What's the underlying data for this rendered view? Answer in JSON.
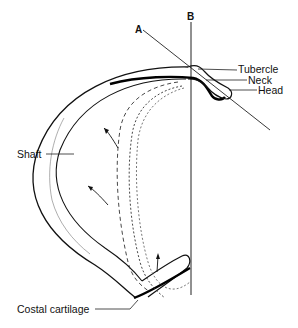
{
  "diagram": {
    "type": "anatomical-line-drawing",
    "axis_labels": {
      "a": "A",
      "b": "B"
    },
    "labels": {
      "tubercle": "Tubercle",
      "neck": "Neck",
      "head": "Head",
      "shaft": "Shaft",
      "costal_cartilage": "Costal cartilage"
    },
    "colors": {
      "line": "#111111",
      "background": "#ffffff"
    }
  }
}
